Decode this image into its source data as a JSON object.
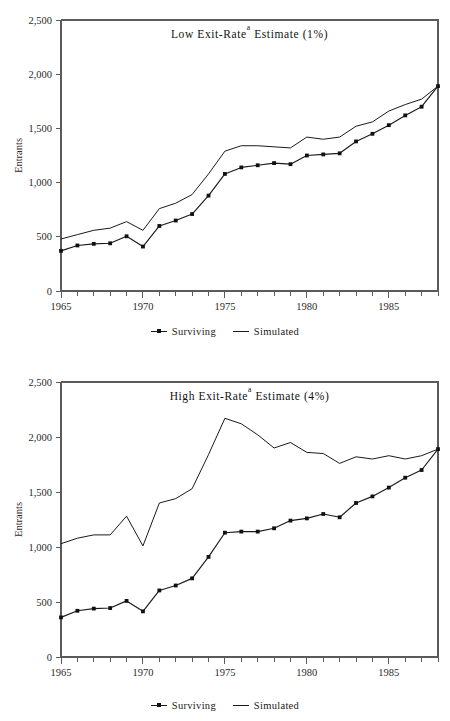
{
  "figure": {
    "background": "#ffffff",
    "line_color": "#1a1a1a",
    "axis_color": "#5a5a5a"
  },
  "panels": [
    {
      "id": "low",
      "title_prefix": "Low Exit-Rate",
      "title_superscript": "a",
      "title_suffix": " Estimate (1%)",
      "title_full": "Low Exit-Rateᵃ Estimate (1%)"
    },
    {
      "id": "high",
      "title_prefix": "High Exit-Rate",
      "title_superscript": "a",
      "title_suffix": " Estimate (4%)",
      "title_full": "High Exit-Rateᵃ Estimate (4%)"
    }
  ],
  "legend": {
    "items": [
      {
        "label": "Surviving",
        "marker": "square",
        "style": "line-with-markers"
      },
      {
        "label": "Simulated",
        "marker": "none",
        "style": "line"
      }
    ]
  },
  "chart_data": [
    {
      "type": "line",
      "title": "Low Exit-Rateᵃ Estimate (1%)",
      "xlabel": "",
      "ylabel": "Entrants",
      "xlim": [
        1965,
        1988
      ],
      "ylim": [
        0,
        2500
      ],
      "yticks": [
        0,
        500,
        1000,
        1500,
        2000,
        2500
      ],
      "ytick_labels": [
        "0",
        "500",
        "1,000",
        "1,500",
        "2,000",
        "2,500"
      ],
      "xticks": [
        1965,
        1970,
        1975,
        1980,
        1985
      ],
      "xtick_labels": [
        "1965",
        "1970",
        "1975",
        "1980",
        "1985"
      ],
      "x_minor_tick_interval": 1,
      "grid": false,
      "legend_position": "below",
      "x": [
        1965,
        1966,
        1967,
        1968,
        1969,
        1970,
        1971,
        1972,
        1973,
        1974,
        1975,
        1976,
        1977,
        1978,
        1979,
        1980,
        1981,
        1982,
        1983,
        1984,
        1985,
        1986,
        1987,
        1988
      ],
      "series": [
        {
          "name": "Surviving",
          "marker": "square",
          "values": [
            370,
            420,
            435,
            440,
            505,
            410,
            600,
            650,
            710,
            880,
            1080,
            1140,
            1160,
            1180,
            1170,
            1250,
            1260,
            1270,
            1380,
            1450,
            1530,
            1620,
            1700,
            1890
          ]
        },
        {
          "name": "Simulated",
          "marker": "none",
          "values": [
            480,
            520,
            560,
            580,
            640,
            560,
            760,
            810,
            890,
            1080,
            1290,
            1340,
            1340,
            1330,
            1320,
            1420,
            1400,
            1420,
            1520,
            1560,
            1660,
            1720,
            1770,
            1890
          ]
        }
      ]
    },
    {
      "type": "line",
      "title": "High Exit-Rateᵃ Estimate (4%)",
      "xlabel": "",
      "ylabel": "Entrants",
      "xlim": [
        1965,
        1988
      ],
      "ylim": [
        0,
        2500
      ],
      "yticks": [
        0,
        500,
        1000,
        1500,
        2000,
        2500
      ],
      "ytick_labels": [
        "0",
        "500",
        "1,000",
        "1,500",
        "2,000",
        "2,500"
      ],
      "xticks": [
        1965,
        1970,
        1975,
        1980,
        1985
      ],
      "xtick_labels": [
        "1965",
        "1970",
        "1975",
        "1980",
        "1985"
      ],
      "x_minor_tick_interval": 1,
      "grid": false,
      "legend_position": "below",
      "x": [
        1965,
        1966,
        1967,
        1968,
        1969,
        1970,
        1971,
        1972,
        1973,
        1974,
        1975,
        1976,
        1977,
        1978,
        1979,
        1980,
        1981,
        1982,
        1983,
        1984,
        1985,
        1986,
        1987,
        1988
      ],
      "series": [
        {
          "name": "Surviving",
          "marker": "square",
          "values": [
            360,
            420,
            440,
            445,
            510,
            415,
            605,
            650,
            715,
            910,
            1130,
            1140,
            1140,
            1170,
            1240,
            1260,
            1300,
            1270,
            1400,
            1460,
            1540,
            1630,
            1700,
            1890
          ]
        },
        {
          "name": "Simulated",
          "marker": "none",
          "values": [
            1030,
            1080,
            1110,
            1110,
            1280,
            1010,
            1400,
            1440,
            1530,
            1840,
            2170,
            2120,
            2020,
            1900,
            1950,
            1860,
            1850,
            1760,
            1820,
            1800,
            1830,
            1800,
            1830,
            1890
          ]
        }
      ]
    }
  ]
}
